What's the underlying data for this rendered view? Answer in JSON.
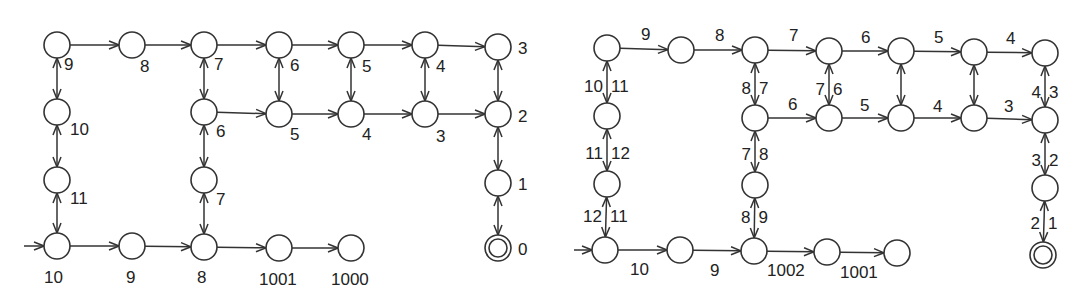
{
  "colors": {
    "stroke": "#333333",
    "text": "#222222",
    "background": "#ffffff"
  },
  "diagrams": [
    {
      "id": "left",
      "description": "State graph with node labels (distance values)",
      "nodes": [
        {
          "id": "L1",
          "x": 57,
          "y": 45,
          "label": "9",
          "lx": 64,
          "ly": 70
        },
        {
          "id": "L2",
          "x": 132,
          "y": 45,
          "label": "8",
          "lx": 140,
          "ly": 72
        },
        {
          "id": "L3",
          "x": 204,
          "y": 45,
          "label": "7",
          "lx": 214,
          "ly": 70
        },
        {
          "id": "L4",
          "x": 279,
          "y": 45,
          "label": "6",
          "lx": 290,
          "ly": 71
        },
        {
          "id": "L5",
          "x": 351,
          "y": 45,
          "label": "5",
          "lx": 362,
          "ly": 72
        },
        {
          "id": "L6",
          "x": 425,
          "y": 45,
          "label": "4",
          "lx": 436,
          "ly": 72
        },
        {
          "id": "L7",
          "x": 498,
          "y": 47,
          "label": "3",
          "lx": 518,
          "ly": 54
        },
        {
          "id": "L8",
          "x": 57,
          "y": 112,
          "label": "10",
          "lx": 70,
          "ly": 135
        },
        {
          "id": "L9",
          "x": 204,
          "y": 112,
          "label": "6",
          "lx": 216,
          "ly": 137
        },
        {
          "id": "L10",
          "x": 279,
          "y": 114,
          "label": "5",
          "lx": 290,
          "ly": 140
        },
        {
          "id": "L11",
          "x": 351,
          "y": 114,
          "label": "4",
          "lx": 362,
          "ly": 140
        },
        {
          "id": "L12",
          "x": 425,
          "y": 114,
          "label": "3",
          "lx": 436,
          "ly": 142
        },
        {
          "id": "L13",
          "x": 498,
          "y": 114,
          "label": "2",
          "lx": 518,
          "ly": 122
        },
        {
          "id": "L14",
          "x": 57,
          "y": 180,
          "label": "11",
          "lx": 70,
          "ly": 204
        },
        {
          "id": "L15",
          "x": 204,
          "y": 180,
          "label": "7",
          "lx": 216,
          "ly": 205
        },
        {
          "id": "L16",
          "x": 498,
          "y": 183,
          "label": "1",
          "lx": 518,
          "ly": 190
        },
        {
          "id": "L17",
          "x": 57,
          "y": 246,
          "label": "10",
          "lx": 44,
          "ly": 283
        },
        {
          "id": "L18",
          "x": 132,
          "y": 246,
          "label": "9",
          "lx": 126,
          "ly": 283
        },
        {
          "id": "L19",
          "x": 204,
          "y": 247,
          "label": "8",
          "lx": 197,
          "ly": 283
        },
        {
          "id": "L20",
          "x": 279,
          "y": 248,
          "label": "1001",
          "lx": 259,
          "ly": 285
        },
        {
          "id": "L21",
          "x": 351,
          "y": 248,
          "label": "1000",
          "lx": 331,
          "ly": 285
        },
        {
          "id": "L22",
          "x": 498,
          "y": 248,
          "label": "0",
          "lx": 518,
          "ly": 255,
          "accepting": true
        }
      ],
      "edges": [
        {
          "from": "L1",
          "to": "L2",
          "type": "directed"
        },
        {
          "from": "L2",
          "to": "L3",
          "type": "directed"
        },
        {
          "from": "L3",
          "to": "L4",
          "type": "directed"
        },
        {
          "from": "L4",
          "to": "L5",
          "type": "directed"
        },
        {
          "from": "L5",
          "to": "L6",
          "type": "directed"
        },
        {
          "from": "L6",
          "to": "L7",
          "type": "directed"
        },
        {
          "from": "L9",
          "to": "L10",
          "type": "directed"
        },
        {
          "from": "L10",
          "to": "L11",
          "type": "directed"
        },
        {
          "from": "L11",
          "to": "L12",
          "type": "directed"
        },
        {
          "from": "L12",
          "to": "L13",
          "type": "directed"
        },
        {
          "from": "L17",
          "to": "L18",
          "type": "directed"
        },
        {
          "from": "L18",
          "to": "L19",
          "type": "directed"
        },
        {
          "from": "L19",
          "to": "L20",
          "type": "directed"
        },
        {
          "from": "L20",
          "to": "L21",
          "type": "directed"
        },
        {
          "from": "L1",
          "to": "L8",
          "type": "bidirectional"
        },
        {
          "from": "L8",
          "to": "L14",
          "type": "bidirectional"
        },
        {
          "from": "L14",
          "to": "L17",
          "type": "bidirectional"
        },
        {
          "from": "L3",
          "to": "L9",
          "type": "bidirectional"
        },
        {
          "from": "L9",
          "to": "L15",
          "type": "bidirectional"
        },
        {
          "from": "L15",
          "to": "L19",
          "type": "bidirectional"
        },
        {
          "from": "L4",
          "to": "L10",
          "type": "bidirectional"
        },
        {
          "from": "L5",
          "to": "L11",
          "type": "bidirectional"
        },
        {
          "from": "L6",
          "to": "L12",
          "type": "bidirectional"
        },
        {
          "from": "L7",
          "to": "L13",
          "type": "bidirectional"
        },
        {
          "from": "L13",
          "to": "L16",
          "type": "bidirectional"
        },
        {
          "from": "L16",
          "to": "L22",
          "type": "bidirectional"
        }
      ],
      "start": {
        "node": "L17",
        "from_x": 24
      }
    },
    {
      "id": "right",
      "description": "State graph with edge weight labels",
      "nodes": [
        {
          "id": "R1",
          "x": 607,
          "y": 48
        },
        {
          "id": "R2",
          "x": 681,
          "y": 50
        },
        {
          "id": "R3",
          "x": 755,
          "y": 50
        },
        {
          "id": "R4",
          "x": 829,
          "y": 51
        },
        {
          "id": "R5",
          "x": 901,
          "y": 51
        },
        {
          "id": "R6",
          "x": 974,
          "y": 52
        },
        {
          "id": "R7",
          "x": 1045,
          "y": 53
        },
        {
          "id": "R8",
          "x": 607,
          "y": 116
        },
        {
          "id": "R9",
          "x": 755,
          "y": 118
        },
        {
          "id": "R10",
          "x": 829,
          "y": 118
        },
        {
          "id": "R11",
          "x": 901,
          "y": 118
        },
        {
          "id": "R12",
          "x": 974,
          "y": 118
        },
        {
          "id": "R13",
          "x": 1045,
          "y": 120
        },
        {
          "id": "R14",
          "x": 607,
          "y": 184
        },
        {
          "id": "R15",
          "x": 755,
          "y": 185
        },
        {
          "id": "R16",
          "x": 1045,
          "y": 188
        },
        {
          "id": "R17",
          "x": 605,
          "y": 250
        },
        {
          "id": "R18",
          "x": 680,
          "y": 250
        },
        {
          "id": "R19",
          "x": 754,
          "y": 251
        },
        {
          "id": "R20",
          "x": 827,
          "y": 252
        },
        {
          "id": "R21",
          "x": 897,
          "y": 253
        },
        {
          "id": "R22",
          "x": 1043,
          "y": 255,
          "accepting": true
        }
      ],
      "edges": [
        {
          "from": "R1",
          "to": "R2",
          "type": "directed",
          "label": "9",
          "lx": 641,
          "ly": 40
        },
        {
          "from": "R2",
          "to": "R3",
          "type": "directed",
          "label": "8",
          "lx": 715,
          "ly": 41
        },
        {
          "from": "R3",
          "to": "R4",
          "type": "directed",
          "label": "7",
          "lx": 789,
          "ly": 41
        },
        {
          "from": "R4",
          "to": "R5",
          "type": "directed",
          "label": "6",
          "lx": 861,
          "ly": 43
        },
        {
          "from": "R5",
          "to": "R6",
          "type": "directed",
          "label": "5",
          "lx": 934,
          "ly": 43
        },
        {
          "from": "R6",
          "to": "R7",
          "type": "directed",
          "label": "4",
          "lx": 1006,
          "ly": 44
        },
        {
          "from": "R9",
          "to": "R10",
          "type": "directed",
          "label": "6",
          "lx": 788,
          "ly": 110
        },
        {
          "from": "R10",
          "to": "R11",
          "type": "directed",
          "label": "5",
          "lx": 860,
          "ly": 111
        },
        {
          "from": "R11",
          "to": "R12",
          "type": "directed",
          "label": "4",
          "lx": 933,
          "ly": 112
        },
        {
          "from": "R12",
          "to": "R13",
          "type": "directed",
          "label": "3",
          "lx": 1004,
          "ly": 112
        },
        {
          "from": "R17",
          "to": "R18",
          "type": "directed",
          "label": "10",
          "lx": 630,
          "ly": 275
        },
        {
          "from": "R18",
          "to": "R19",
          "type": "directed",
          "label": "9",
          "lx": 710,
          "ly": 276
        },
        {
          "from": "R19",
          "to": "R20",
          "type": "directed",
          "label": "1002",
          "lx": 767,
          "ly": 276
        },
        {
          "from": "R20",
          "to": "R21",
          "type": "directed",
          "label": "1001",
          "lx": 840,
          "ly": 278
        },
        {
          "from": "R1",
          "to": "R8",
          "type": "bidirectional",
          "left": "10",
          "right": "11",
          "ly": 92
        },
        {
          "from": "R8",
          "to": "R14",
          "type": "bidirectional",
          "left": "11",
          "right": "12",
          "ly": 159
        },
        {
          "from": "R14",
          "to": "R17",
          "type": "bidirectional",
          "left": "12",
          "right": "11",
          "ly": 222
        },
        {
          "from": "R3",
          "to": "R9",
          "type": "bidirectional",
          "left": "8",
          "right": "7",
          "ly": 94
        },
        {
          "from": "R9",
          "to": "R15",
          "type": "bidirectional",
          "left": "7",
          "right": "8",
          "ly": 160
        },
        {
          "from": "R15",
          "to": "R19",
          "type": "bidirectional",
          "left": "8",
          "right": "9",
          "ly": 223
        },
        {
          "from": "R4",
          "to": "R10",
          "type": "bidirectional",
          "left": "7",
          "right": "6",
          "ly": 95
        },
        {
          "from": "R5",
          "to": "R11",
          "type": "bidirectional"
        },
        {
          "from": "R6",
          "to": "R12",
          "type": "bidirectional"
        },
        {
          "from": "R7",
          "to": "R13",
          "type": "bidirectional",
          "left": "4",
          "right": "3",
          "ly": 98
        },
        {
          "from": "R13",
          "to": "R16",
          "type": "bidirectional",
          "left": "3",
          "right": "2",
          "ly": 166
        },
        {
          "from": "R16",
          "to": "R22",
          "type": "bidirectional",
          "left": "2",
          "right": "1",
          "ly": 229
        }
      ],
      "start": {
        "node": "R17",
        "from_x": 574
      }
    }
  ]
}
